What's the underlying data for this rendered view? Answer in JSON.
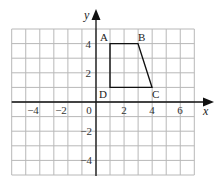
{
  "chart_data": {
    "type": "diagram",
    "title": "",
    "xlabel": "x",
    "ylabel": "y",
    "xlim": [
      -6,
      7
    ],
    "ylim": [
      -5,
      5
    ],
    "grid": true,
    "x_tick_labels": [
      "−4",
      "−2",
      "0",
      "2",
      "4",
      "6"
    ],
    "x_tick_values": [
      -4,
      -2,
      0,
      2,
      4,
      6
    ],
    "y_tick_labels": [
      "4",
      "2",
      "−2",
      "−4"
    ],
    "y_tick_values": [
      4,
      2,
      -2,
      -4
    ],
    "shape": {
      "name": "ABCD",
      "kind": "trapezium",
      "vertices": [
        {
          "label": "A",
          "x": 1,
          "y": 4
        },
        {
          "label": "B",
          "x": 3,
          "y": 4
        },
        {
          "label": "C",
          "x": 4,
          "y": 1
        },
        {
          "label": "D",
          "x": 1,
          "y": 1
        }
      ]
    }
  },
  "labels": {
    "x_axis": "x",
    "y_axis": "y",
    "origin": "0",
    "A": "A",
    "B": "B",
    "C": "C",
    "D": "D",
    "xt_m4": "−4",
    "xt_m2": "−2",
    "xt_2": "2",
    "xt_4": "4",
    "xt_6": "6",
    "yt_4": "4",
    "yt_2": "2",
    "yt_m2": "−2",
    "yt_m4": "−4"
  },
  "colors": {
    "grid": "#b8b8b8",
    "axis": "#111111",
    "shape": "#111111"
  }
}
